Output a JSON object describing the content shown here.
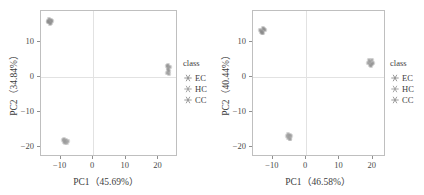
{
  "chart_data": [
    {
      "type": "scatter",
      "panel": "left",
      "title": "",
      "xlabel": "PC1（45.69%）",
      "ylabel": "PC2（34.84%）",
      "xlim": [
        -16,
        26
      ],
      "ylim": [
        -23,
        19
      ],
      "xticks": [
        -10,
        0,
        10,
        20
      ],
      "xtick_labels": [
        "−10",
        "0",
        "10",
        "20"
      ],
      "yticks": [
        10,
        0,
        -10,
        -20
      ],
      "ytick_labels": [
        "10",
        "0",
        "−10",
        "−20"
      ],
      "grid": false,
      "reference_lines": {
        "x": 0,
        "y": 0
      },
      "legend": {
        "title": "class",
        "position": "right",
        "entries": [
          "EC",
          "HC",
          "CC"
        ]
      },
      "series": [
        {
          "name": "EC",
          "color": "#8a8a8a",
          "marker": "asterisk",
          "points": [
            [
              -13.4,
              15.9
            ],
            [
              -13.0,
              16.4
            ],
            [
              -13.8,
              16.1
            ],
            [
              -13.2,
              15.3
            ],
            [
              -12.7,
              16.0
            ],
            [
              -13.5,
              16.7
            ],
            [
              -14.0,
              15.7
            ],
            [
              -12.9,
              15.6
            ]
          ]
        },
        {
          "name": "HC",
          "color": "#9a9a9a",
          "marker": "asterisk",
          "points": [
            [
              -8.7,
              -18.4
            ],
            [
              -8.2,
              -18.0
            ],
            [
              -9.1,
              -18.7
            ],
            [
              -8.5,
              -19.0
            ],
            [
              -7.8,
              -18.3
            ],
            [
              -9.4,
              -18.1
            ],
            [
              -8.0,
              -18.9
            ],
            [
              -8.9,
              -17.8
            ]
          ]
        },
        {
          "name": "CC",
          "color": "#8f8f8f",
          "marker": "asterisk",
          "points": [
            [
              22.9,
              2.6
            ],
            [
              23.3,
              1.8
            ],
            [
              22.6,
              3.1
            ],
            [
              23.1,
              0.9
            ],
            [
              22.8,
              2.0
            ],
            [
              23.4,
              2.9
            ],
            [
              22.7,
              1.2
            ],
            [
              23.0,
              3.4
            ]
          ]
        }
      ]
    },
    {
      "type": "scatter",
      "panel": "right",
      "title": "",
      "xlabel": "PC1（46.58%）",
      "ylabel": "PC2（40.44%）",
      "xlim": [
        -16,
        24
      ],
      "ylim": [
        -23,
        19
      ],
      "xticks": [
        -10,
        0,
        10,
        20
      ],
      "xtick_labels": [
        "−10",
        "0",
        "10",
        "20"
      ],
      "yticks": [
        10,
        0,
        -10,
        -20
      ],
      "ytick_labels": [
        "10",
        "0",
        "−10",
        "−20"
      ],
      "grid": false,
      "reference_lines": {
        "x": 0,
        "y": 0
      },
      "legend": {
        "title": "class",
        "position": "right",
        "entries": [
          "EC",
          "HC",
          "CC"
        ]
      },
      "series": [
        {
          "name": "EC",
          "color": "#8a8a8a",
          "marker": "asterisk",
          "points": [
            [
              -13.2,
              13.3
            ],
            [
              -12.8,
              13.8
            ],
            [
              -13.6,
              12.9
            ],
            [
              -13.0,
              12.6
            ],
            [
              -12.5,
              13.5
            ],
            [
              -13.8,
              13.6
            ],
            [
              -12.9,
              14.1
            ],
            [
              -13.4,
              12.8
            ]
          ]
        },
        {
          "name": "HC",
          "color": "#9a9a9a",
          "marker": "asterisk",
          "points": [
            [
              -5.3,
              -17.1
            ],
            [
              -4.8,
              -16.6
            ],
            [
              -5.6,
              -17.6
            ],
            [
              -5.0,
              -17.9
            ],
            [
              -4.5,
              -17.0
            ],
            [
              -5.8,
              -16.9
            ],
            [
              -4.9,
              -17.7
            ],
            [
              -5.4,
              -16.4
            ]
          ]
        },
        {
          "name": "CC",
          "color": "#8f8f8f",
          "marker": "asterisk",
          "points": [
            [
              19.2,
              4.3
            ],
            [
              19.7,
              3.7
            ],
            [
              18.9,
              4.8
            ],
            [
              19.4,
              3.2
            ],
            [
              20.1,
              4.1
            ],
            [
              18.7,
              3.9
            ],
            [
              19.9,
              4.9
            ],
            [
              19.1,
              3.4
            ]
          ]
        }
      ]
    }
  ],
  "style": {
    "background": "#ffffff",
    "frame_color": "#bfbfbf",
    "reference_line_color": "#e2e2e2",
    "text_color": "#3d3d3d",
    "tick_color": "#8f8f8f"
  }
}
